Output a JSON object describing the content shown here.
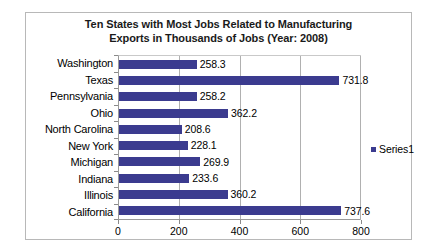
{
  "chart_data": {
    "type": "bar",
    "orientation": "horizontal",
    "title": "Ten States with Most Jobs Related to Manufacturing Exports in Thousands of Jobs (Year: 2008)",
    "title_lines": [
      "Ten States with Most Jobs Related to Manufacturing",
      "Exports in Thousands of Jobs (Year: 2008)"
    ],
    "categories": [
      "Washington",
      "Texas",
      "Pennsylvania",
      "Ohio",
      "North Carolina",
      "New York",
      "Michigan",
      "Indiana",
      "Illinois",
      "California"
    ],
    "values": [
      258.3,
      731.8,
      258.2,
      362.2,
      208.6,
      228.1,
      269.9,
      233.6,
      360.2,
      737.6
    ],
    "value_labels": [
      "258.3",
      "731.8",
      "258.2",
      "362.2",
      "208.6",
      "228.1",
      "269.9",
      "233.6",
      "360.2",
      "737.6"
    ],
    "series": [
      {
        "name": "Series1",
        "color": "#3b3b8f",
        "values": [
          258.3,
          731.8,
          258.2,
          362.2,
          208.6,
          228.1,
          269.9,
          233.6,
          360.2,
          737.6
        ]
      }
    ],
    "xlabel": "",
    "ylabel": "",
    "xlim": [
      0,
      800
    ],
    "xticks": [
      0,
      200,
      400,
      600,
      800
    ],
    "xtick_labels": [
      "0",
      "200",
      "400",
      "600",
      "800"
    ],
    "grid": "vertical",
    "gridlines_at": [
      200,
      400,
      600,
      800
    ],
    "legend": {
      "position": "right",
      "entries": [
        "Series1"
      ]
    },
    "colors": {
      "bar": "#3b3b8f",
      "plot_background": "#ffffff",
      "chart_background": "#ffffff",
      "border": "#b8b8b8",
      "gridline": "#b0b0b0",
      "axis": "#8a8a8a",
      "text": "#000000"
    }
  }
}
